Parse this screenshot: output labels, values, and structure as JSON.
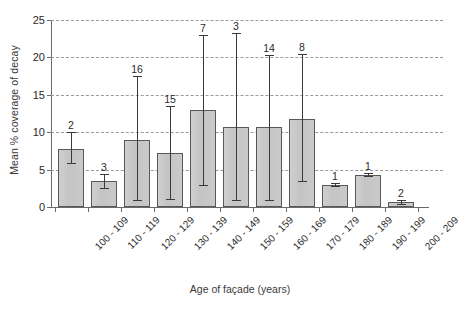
{
  "chart_data": {
    "type": "bar",
    "title": "",
    "xlabel": "Age of façade (years)",
    "ylabel": "Mean % coverage of decay",
    "ylim": [
      0,
      25
    ],
    "yticks": [
      0,
      5,
      10,
      15,
      20,
      25
    ],
    "ytick_labels": [
      "0",
      "5",
      "10",
      "15",
      "20",
      "25"
    ],
    "grid": "horizontal-dashed",
    "legend": "none",
    "error_bars": "asymmetric-range",
    "categories": [
      "100 - 109",
      "110 - 119",
      "120 - 129",
      "130 - 139",
      "140 - 149",
      "150 - 159",
      "160 - 169",
      "170 - 179",
      "180 - 189",
      "190 - 199",
      "200 - 209"
    ],
    "values": [
      7.8,
      3.5,
      9.0,
      7.2,
      13.0,
      10.7,
      10.7,
      11.8,
      3.0,
      4.3,
      0.7
    ],
    "err_low": [
      5.9,
      2.5,
      1.0,
      1.1,
      3.0,
      1.0,
      1.0,
      3.5,
      2.8,
      4.1,
      0.4
    ],
    "err_high": [
      10.0,
      4.4,
      17.5,
      13.5,
      23.0,
      23.2,
      20.3,
      20.5,
      3.2,
      4.5,
      0.9
    ],
    "n_labels": [
      "2",
      "3",
      "16",
      "15",
      "7",
      "3",
      "14",
      "8",
      "1",
      "1",
      "2"
    ],
    "bar_fill": "#c8c8c8",
    "bar_edge": "#585858",
    "grid_color": "#9a9a9a",
    "axis_color": "#6a6a6a"
  }
}
